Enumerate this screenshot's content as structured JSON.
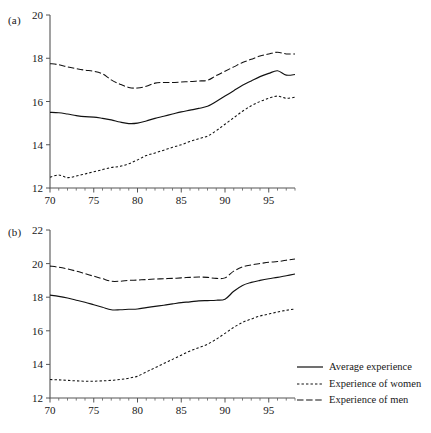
{
  "figure": {
    "panels": [
      {
        "label": "(a)",
        "ylabel": "",
        "xlabel": "",
        "ylim": [
          12,
          20
        ],
        "xlim": [
          70,
          98
        ],
        "yticks": [
          12,
          14,
          16,
          18,
          20
        ],
        "xticks": [
          70,
          75,
          80,
          85,
          90,
          95
        ]
      },
      {
        "label": "(b)",
        "ylabel": "",
        "xlabel": "",
        "ylim": [
          12,
          22
        ],
        "xlim": [
          70,
          98
        ],
        "yticks": [
          12,
          14,
          16,
          18,
          20,
          22
        ],
        "xticks": [
          70,
          75,
          80,
          85,
          90,
          95
        ]
      }
    ]
  },
  "legend": {
    "position": "bottom-right",
    "items": [
      {
        "label": "Average experience",
        "style": "solid",
        "icon": "solid-line-icon"
      },
      {
        "label": "Experience of women",
        "style": "dotted",
        "icon": "dotted-line-icon"
      },
      {
        "label": "Experience of men",
        "style": "dashed",
        "icon": "dashed-line-icon"
      }
    ]
  },
  "chart_data": [
    {
      "type": "line",
      "panel": "(a)",
      "title": "",
      "xlabel": "",
      "ylabel": "",
      "xlim": [
        70,
        98
      ],
      "ylim": [
        12,
        20
      ],
      "grid": false,
      "x": [
        70,
        71,
        72,
        73,
        74,
        75,
        76,
        77,
        78,
        79,
        80,
        81,
        82,
        83,
        84,
        85,
        86,
        87,
        88,
        89,
        90,
        91,
        92,
        93,
        94,
        95,
        96,
        97,
        98
      ],
      "series": [
        {
          "name": "Average experience",
          "style": "solid",
          "values": [
            15.5,
            15.48,
            15.42,
            15.35,
            15.3,
            15.28,
            15.22,
            15.15,
            15.05,
            14.98,
            15.0,
            15.1,
            15.22,
            15.32,
            15.42,
            15.52,
            15.6,
            15.68,
            15.78,
            16.0,
            16.25,
            16.5,
            16.75,
            16.95,
            17.15,
            17.3,
            17.42,
            17.22,
            17.25
          ]
        },
        {
          "name": "Experience of women",
          "style": "dotted",
          "values": [
            12.5,
            12.6,
            12.48,
            12.55,
            12.65,
            12.75,
            12.85,
            12.95,
            13.0,
            13.12,
            13.3,
            13.5,
            13.62,
            13.75,
            13.88,
            14.0,
            14.15,
            14.28,
            14.4,
            14.65,
            14.95,
            15.25,
            15.55,
            15.8,
            16.0,
            16.15,
            16.25,
            16.15,
            16.2
          ]
        },
        {
          "name": "Experience of men",
          "style": "dashed",
          "values": [
            17.75,
            17.7,
            17.6,
            17.52,
            17.45,
            17.4,
            17.28,
            17.0,
            16.8,
            16.65,
            16.62,
            16.7,
            16.85,
            16.88,
            16.88,
            16.9,
            16.92,
            16.95,
            16.98,
            17.2,
            17.4,
            17.6,
            17.8,
            17.95,
            18.1,
            18.2,
            18.28,
            18.2,
            18.2
          ]
        }
      ]
    },
    {
      "type": "line",
      "panel": "(b)",
      "title": "",
      "xlabel": "",
      "ylabel": "",
      "xlim": [
        70,
        98
      ],
      "ylim": [
        12,
        22
      ],
      "grid": false,
      "x": [
        70,
        71,
        72,
        73,
        74,
        75,
        76,
        77,
        78,
        79,
        80,
        81,
        82,
        83,
        84,
        85,
        86,
        87,
        88,
        89,
        90,
        91,
        92,
        93,
        94,
        95,
        96,
        97,
        98
      ],
      "series": [
        {
          "name": "Average experience",
          "style": "solid",
          "values": [
            18.12,
            18.05,
            17.95,
            17.82,
            17.7,
            17.55,
            17.4,
            17.25,
            17.25,
            17.28,
            17.3,
            17.38,
            17.45,
            17.52,
            17.6,
            17.68,
            17.72,
            17.78,
            17.8,
            17.82,
            17.88,
            18.35,
            18.7,
            18.88,
            19.0,
            19.1,
            19.18,
            19.28,
            19.38
          ]
        },
        {
          "name": "Experience of women",
          "style": "dotted",
          "values": [
            13.1,
            13.08,
            13.05,
            13.02,
            13.0,
            13.0,
            13.02,
            13.05,
            13.1,
            13.18,
            13.3,
            13.55,
            13.8,
            14.05,
            14.3,
            14.55,
            14.8,
            15.0,
            15.2,
            15.5,
            15.85,
            16.2,
            16.5,
            16.7,
            16.88,
            17.0,
            17.12,
            17.22,
            17.3
          ]
        },
        {
          "name": "Experience of men",
          "style": "dashed",
          "values": [
            19.85,
            19.78,
            19.68,
            19.55,
            19.4,
            19.25,
            19.1,
            18.95,
            18.95,
            19.0,
            19.02,
            19.05,
            19.08,
            19.1,
            19.12,
            19.15,
            19.18,
            19.2,
            19.18,
            19.12,
            19.15,
            19.55,
            19.8,
            19.92,
            20.0,
            20.08,
            20.12,
            20.2,
            20.28
          ]
        }
      ]
    }
  ]
}
